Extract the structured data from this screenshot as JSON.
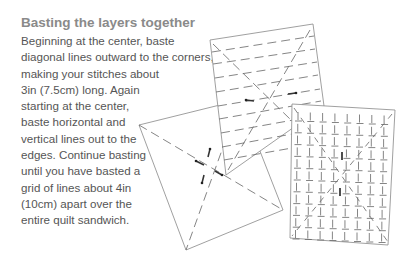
{
  "heading": "Basting the layers together",
  "body_lines": [
    "Beginning at the center, baste",
    "diagonal lines outward to the corners,",
    "making your stitches about",
    "3in (7.5cm) long. Again",
    "starting at the center,",
    "baste horizontal and",
    "vertical lines out to the",
    "edges. Continue basting",
    "until you have basted a",
    "grid of lines about 4in",
    "(10cm) apart over the",
    "entire quilt sandwich."
  ],
  "illustration": {
    "description": "Three quilt sandwiches showing basting patterns",
    "panels": [
      {
        "name": "diagonal-basting",
        "pattern": "diagonal lines from center to corners"
      },
      {
        "name": "horizontal-basting",
        "pattern": "diagonals plus horizontal lines"
      },
      {
        "name": "grid-basting",
        "pattern": "grid of vertical and horizontal stitches"
      }
    ],
    "line_color": "#777777"
  }
}
